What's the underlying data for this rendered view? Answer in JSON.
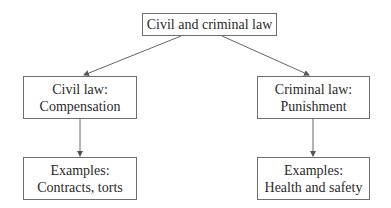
{
  "diagram": {
    "root": {
      "label": "Civil and criminal law"
    },
    "civil": {
      "line1": "Civil law:",
      "line2": "Compensation"
    },
    "criminal": {
      "line1": "Criminal law:",
      "line2": "Punishment"
    },
    "civil_examples": {
      "line1": "Examples:",
      "line2": "Contracts, torts"
    },
    "criminal_examples": {
      "line1": "Examples:",
      "line2": "Health and safety"
    },
    "colors": {
      "border": "#6e6e6e",
      "arrow": "#555555",
      "text": "#2a2a2a"
    }
  }
}
